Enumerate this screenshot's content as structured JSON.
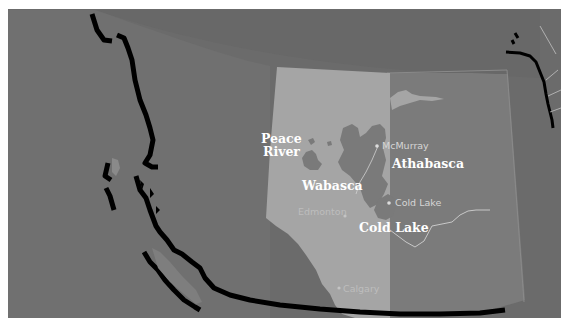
{
  "map": {
    "title": "Oil sands deposits of Alberta",
    "colors": {
      "background": "#6b6b6b",
      "ocean": "#6a6a6a",
      "british_columbia": "#747474",
      "alberta": "#a6a6a6",
      "saskatchewan": "#7c7c7c",
      "deposit": "#7a7a7a",
      "coastline": "#000000",
      "border_white": "#ffffff"
    },
    "regions": [
      {
        "name": "British Columbia"
      },
      {
        "name": "Alberta"
      },
      {
        "name": "Saskatchewan"
      }
    ],
    "deposit_labels": [
      {
        "id": "peace-river",
        "line1": "Peace",
        "line2": "River"
      },
      {
        "id": "wabasca",
        "line1": "Wabasca"
      },
      {
        "id": "athabasca",
        "line1": "Athabasca"
      },
      {
        "id": "cold-lake",
        "line1": "Cold Lake"
      }
    ],
    "city_labels": [
      {
        "id": "mcmurray",
        "name": "McMurray"
      },
      {
        "id": "cold-lake-town",
        "name": "Cold Lake"
      },
      {
        "id": "edmonton",
        "name": "Edmonton"
      },
      {
        "id": "calgary",
        "name": "Calgary"
      }
    ]
  }
}
